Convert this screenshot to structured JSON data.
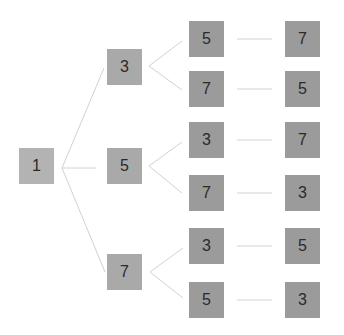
{
  "diagram": {
    "type": "tree",
    "colors": {
      "root": "#b3b3b3",
      "level1": "#a9a9a9",
      "level2": "#9b9b9b",
      "level3": "#9b9b9b",
      "line": "#d2d2d2",
      "text": "#2a2a2a"
    },
    "root": {
      "label": "1",
      "x": 19,
      "y": 148
    },
    "level1": [
      {
        "label": "3",
        "x": 107,
        "y": 49
      },
      {
        "label": "5",
        "x": 107,
        "y": 148
      },
      {
        "label": "7",
        "x": 107,
        "y": 254
      }
    ],
    "level2": [
      {
        "label": "5",
        "x": 189,
        "y": 21,
        "parent": 0
      },
      {
        "label": "7",
        "x": 189,
        "y": 71,
        "parent": 0
      },
      {
        "label": "3",
        "x": 189,
        "y": 122,
        "parent": 1
      },
      {
        "label": "7",
        "x": 189,
        "y": 175,
        "parent": 1
      },
      {
        "label": "3",
        "x": 189,
        "y": 228,
        "parent": 2
      },
      {
        "label": "5",
        "x": 189,
        "y": 282,
        "parent": 2
      }
    ],
    "level3": [
      {
        "label": "7",
        "x": 285,
        "y": 21
      },
      {
        "label": "5",
        "x": 285,
        "y": 71
      },
      {
        "label": "7",
        "x": 285,
        "y": 122
      },
      {
        "label": "3",
        "x": 285,
        "y": 175
      },
      {
        "label": "5",
        "x": 285,
        "y": 228
      },
      {
        "label": "3",
        "x": 285,
        "y": 282
      }
    ]
  }
}
